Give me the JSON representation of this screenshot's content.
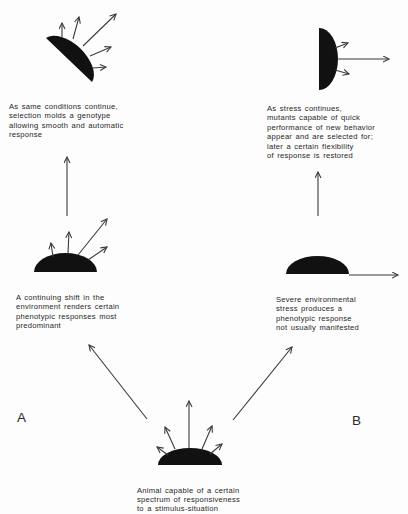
{
  "diagram": {
    "panel_labels": {
      "a": "A",
      "b": "B"
    },
    "nodes": {
      "start": {
        "lines": [
          "Animal capable of a certain",
          "spectrum of responsiveness",
          "to a stimulus-situation"
        ]
      },
      "a1": {
        "lines": [
          "A continuing shift in the",
          "environment renders certain",
          "phenotypic responses most",
          "predominant"
        ]
      },
      "a2": {
        "lines": [
          "As same conditions continue,",
          "selection molds a genotype",
          "allowing smooth and automatic",
          "response"
        ]
      },
      "b1": {
        "lines": [
          "Severe environmental",
          "stress produces a",
          "phenotypic response",
          "not usually manifested"
        ]
      },
      "b2": {
        "lines": [
          "As stress continues,",
          "mutants capable of quick",
          "performance of new behavior",
          "appear and are selected for;",
          "later a certain flexibility",
          "of response is restored"
        ]
      }
    },
    "edges": [
      {
        "from": "start",
        "to": "a1",
        "path": "A"
      },
      {
        "from": "a1",
        "to": "a2",
        "path": "A"
      },
      {
        "from": "start",
        "to": "b1",
        "path": "B"
      },
      {
        "from": "b1",
        "to": "b2",
        "path": "B"
      }
    ],
    "colors": {
      "shape": "#111111",
      "arrow": "#3a3a3a",
      "text": "#262626"
    }
  }
}
